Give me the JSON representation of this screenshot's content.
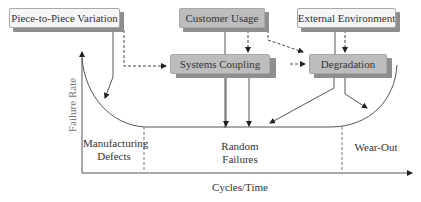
{
  "boxes": {
    "piece_variation": "Piece-to-Piece Variation",
    "customer_usage": "Customer Usage",
    "external_environment": "External Environment",
    "systems_coupling": "Systems Coupling",
    "degradation": "Degradation"
  },
  "axes": {
    "y_label": "Failure Rate",
    "x_label": "Cycles/Time"
  },
  "regions": {
    "manufacturing": [
      "Manufacturing",
      "Defects"
    ],
    "random": [
      "Random",
      "Failures"
    ],
    "wearout": "Wear-Out"
  },
  "colors": {
    "light_box": "#f6f6f6",
    "dark_box": "#bdbdbd",
    "shadow": "#8e8e8e",
    "line": "#555555"
  }
}
